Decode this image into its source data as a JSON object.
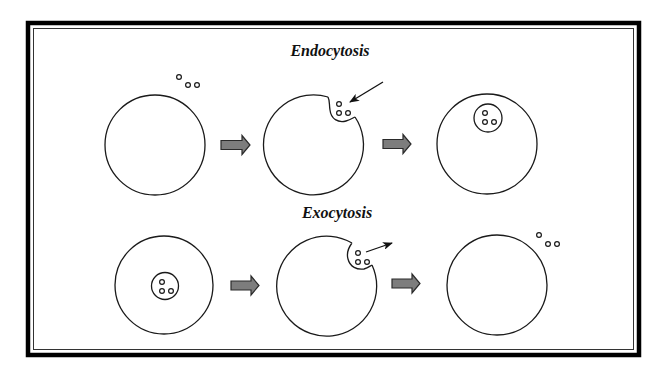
{
  "diagram": {
    "titles": {
      "endocytosis": "Endocytosis",
      "exocytosis": "Exocytosis"
    },
    "rows": [
      {
        "name": "endocytosis",
        "stages": [
          {
            "label": "particles outside cell"
          },
          {
            "label": "membrane invaginates around particles"
          },
          {
            "label": "vesicle formed inside cell"
          }
        ]
      },
      {
        "name": "exocytosis",
        "stages": [
          {
            "label": "vesicle inside cell"
          },
          {
            "label": "vesicle fuses with membrane, releasing particles"
          },
          {
            "label": "particles released outside cell"
          }
        ]
      }
    ],
    "icons": {
      "step": "right-block-arrow",
      "pointer": "thin-arrow"
    },
    "colors": {
      "frame": "#000000",
      "line": "#1a1a1a",
      "arrow_fill": "#7d7d7d",
      "background": "#ffffff"
    }
  }
}
